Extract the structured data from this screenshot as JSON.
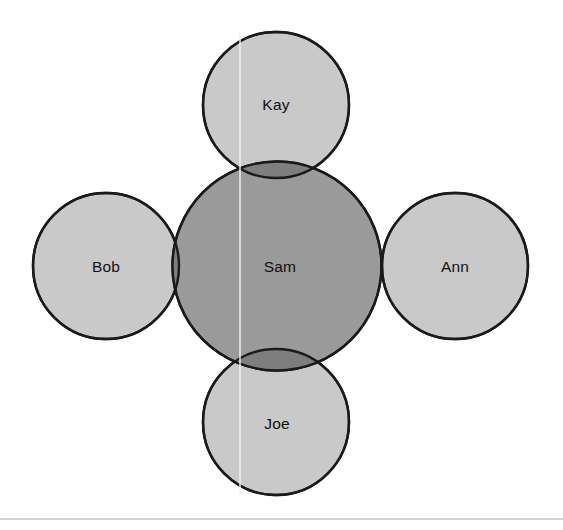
{
  "diagram": {
    "type": "venn",
    "canvas": {
      "width": 563,
      "height": 530,
      "background": "#ffffff"
    },
    "colors": {
      "peripheral_fill": "#c9c9c9",
      "center_fill": "#9a9a9a",
      "overlap_fill": "#7e7e7e",
      "outline": "#1a1a1a",
      "label_text": "#111111",
      "footer_rule": "#a8a8a8",
      "scanline": "#f2f2f2"
    },
    "nodes": [
      {
        "id": "kay",
        "label": "Kay",
        "role": "peripheral",
        "position": "top",
        "cx": 276,
        "cy": 105,
        "r": 73,
        "fill": "#c9c9c9"
      },
      {
        "id": "bob",
        "label": "Bob",
        "role": "peripheral",
        "position": "left",
        "cx": 106,
        "cy": 266,
        "r": 73,
        "fill": "#c9c9c9"
      },
      {
        "id": "ann",
        "label": "Ann",
        "role": "peripheral",
        "position": "right",
        "cx": 455,
        "cy": 266,
        "r": 73,
        "fill": "#c9c9c9"
      },
      {
        "id": "joe",
        "label": "Joe",
        "role": "peripheral",
        "position": "bottom",
        "cx": 276,
        "cy": 422,
        "r": 73,
        "fill": "#c9c9c9"
      },
      {
        "id": "sam",
        "label": "Sam",
        "role": "center",
        "position": "center",
        "cx": 277,
        "cy": 266,
        "r": 104.5,
        "fill": "#9a9a9a"
      }
    ],
    "overlaps": [
      {
        "id": "sam-kay",
        "between": [
          "sam",
          "kay"
        ],
        "fill": "#7e7e7e"
      },
      {
        "id": "sam-bob",
        "between": [
          "sam",
          "bob"
        ],
        "fill": "#7e7e7e"
      },
      {
        "id": "sam-ann",
        "between": [
          "sam",
          "ann"
        ],
        "fill": "#7e7e7e"
      },
      {
        "id": "sam-joe",
        "between": [
          "sam",
          "joe"
        ],
        "fill": "#7e7e7e"
      }
    ],
    "footer_rule": {
      "y": 519,
      "x1": 0,
      "x2": 563
    },
    "scanline": {
      "x": 240,
      "y1": 32,
      "y2": 495
    }
  }
}
